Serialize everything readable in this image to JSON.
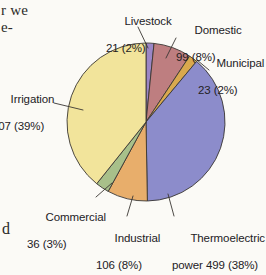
{
  "page": {
    "body_fragments": [
      {
        "name": "text-fragment-top-1",
        "text": "r we"
      },
      {
        "name": "text-fragment-top-2",
        "text": "e-"
      },
      {
        "name": "text-fragment-bottom",
        "text": "d"
      }
    ]
  },
  "chart_data": {
    "type": "pie",
    "title": "",
    "subtitle": "",
    "xlabel": "",
    "ylabel": "",
    "legend_position": "none",
    "grid": false,
    "total": 1291,
    "start_angle_deg": 0,
    "direction": "clockwise",
    "categories": [
      "Livestock",
      "Domestic",
      "Municipal",
      "Thermoelectric power",
      "Industrial",
      "Commercial",
      "Irrigation"
    ],
    "values": [
      21,
      99,
      23,
      499,
      106,
      36,
      507
    ],
    "percents": [
      2,
      8,
      2,
      38,
      8,
      3,
      39
    ],
    "colors": [
      "#9B86C6",
      "#BE7E80",
      "#D9A94E",
      "#8C8CCB",
      "#E8AE6B",
      "#A8C08A",
      "#F2E49B"
    ],
    "slices": [
      {
        "name": "livestock",
        "label": "Livestock",
        "value": 21,
        "percent": 2,
        "color": "#9B86C6",
        "label_line1": "Livestock",
        "label_line2": "21 (2%)"
      },
      {
        "name": "domestic",
        "label": "Domestic",
        "value": 99,
        "percent": 8,
        "color": "#BE7E80",
        "label_line1": "Domestic",
        "label_line2": "99 (8%)"
      },
      {
        "name": "municipal",
        "label": "Municipal",
        "value": 23,
        "percent": 2,
        "color": "#D9A94E",
        "label_line1": "Municipal",
        "label_line2": "23 (2%)"
      },
      {
        "name": "thermoelectric-power",
        "label": "Thermoelectric power",
        "value": 499,
        "percent": 38,
        "color": "#8C8CCB",
        "label_line1": "Thermoelectric",
        "label_line2": "power 499 (38%)"
      },
      {
        "name": "industrial",
        "label": "Industrial",
        "value": 106,
        "percent": 8,
        "color": "#E8AE6B",
        "label_line1": "Industrial",
        "label_line2": "106 (8%)"
      },
      {
        "name": "commercial",
        "label": "Commercial",
        "value": 36,
        "percent": 3,
        "color": "#A8C08A",
        "label_line1": "Commercial",
        "label_line2": "36 (3%)"
      },
      {
        "name": "irrigation",
        "label": "Irrigation",
        "value": 507,
        "percent": 39,
        "color": "#F2E49B",
        "label_line1": "Irrigation",
        "label_line2": "507 (39%)"
      }
    ]
  }
}
